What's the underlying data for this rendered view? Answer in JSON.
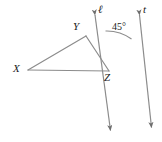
{
  "figure": {
    "type": "geometry-diagram",
    "background_color": "#ffffff",
    "stroke_color": "#8c8c8c",
    "text_color": "#1a1a1a",
    "width": 162,
    "height": 142
  },
  "vertices": [
    {
      "name": "X",
      "label": "X",
      "x": 28,
      "y": 70
    },
    {
      "name": "Y",
      "label": "Y",
      "x": 86,
      "y": 36
    },
    {
      "name": "Z",
      "label": "Z",
      "x": 109,
      "y": 71
    }
  ],
  "triangle": {
    "name": "triangle-XYZ",
    "sides": [
      "XY",
      "YZ",
      "XZ"
    ]
  },
  "lines": [
    {
      "name": "line-l",
      "label": "ℓ",
      "description": "line through Z rising up-left past Y, arrowheads both ends",
      "from_x": 94,
      "from_y": 14,
      "to_x": 111,
      "to_y": 132
    },
    {
      "name": "line-t",
      "label": "t",
      "description": "line through Z rising up-right, arrowheads both ends",
      "from_x": 140,
      "from_y": 14,
      "to_x": 152,
      "to_y": 129
    }
  ],
  "angles": [
    {
      "name": "angle-45",
      "label": "45°",
      "value": 45,
      "unit": "degrees",
      "vertex": "Z",
      "between": [
        "line-l",
        "line-t"
      ]
    }
  ],
  "arrowheads": [
    {
      "name": "arrow-l-top",
      "x": 94,
      "y": 14,
      "direction": "up-left"
    },
    {
      "name": "arrow-l-bottom",
      "x": 111,
      "y": 132,
      "direction": "down-right"
    },
    {
      "name": "arrow-t-top",
      "x": 140,
      "y": 14,
      "direction": "up-right"
    },
    {
      "name": "arrow-t-bottom",
      "x": 152,
      "y": 129,
      "direction": "down-right"
    }
  ]
}
